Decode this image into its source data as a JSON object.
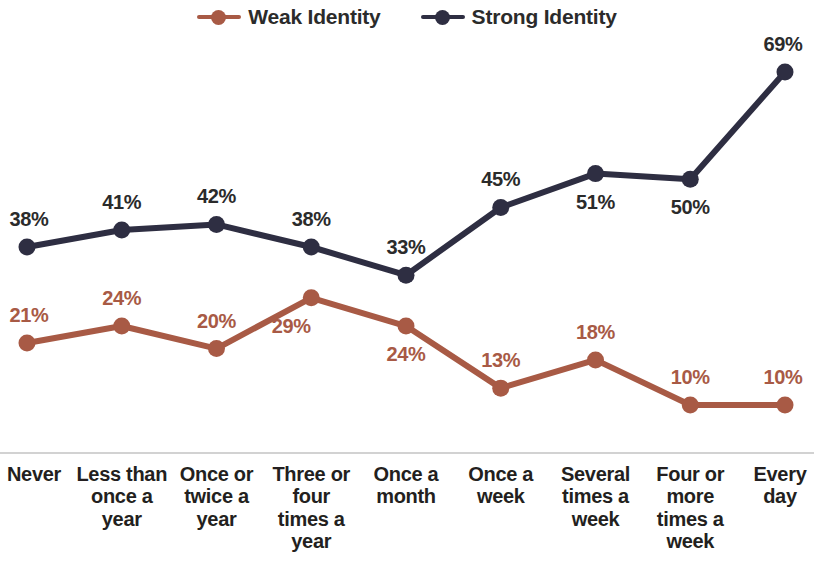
{
  "legend": {
    "items": [
      {
        "label": "Weak Identity",
        "color": "#a85a45",
        "marker": "line-dot-marker"
      },
      {
        "label": "Strong Identity",
        "color": "#2e2e42",
        "marker": "line-dot-marker"
      }
    ]
  },
  "axis": {
    "line_color": "#d2d2d2"
  },
  "chart_data": {
    "type": "line",
    "title": "",
    "subtitle": "",
    "xlabel": "",
    "ylabel": "",
    "grid": false,
    "legend_position": "top-center",
    "ylim": [
      0,
      75
    ],
    "value_suffix": "%",
    "categories": [
      "Never",
      "Less than once a year",
      "Once or twice a year",
      "Three or four times a year",
      "Once a month",
      "Once a week",
      "Several times a week",
      "Four or more times a week",
      "Every day"
    ],
    "category_lines": [
      [
        "Never"
      ],
      [
        "Less than",
        "once a",
        "year"
      ],
      [
        "Once or",
        "twice a",
        "year"
      ],
      [
        "Three or",
        "four",
        "times a",
        "year"
      ],
      [
        "Once a",
        "month"
      ],
      [
        "Once a",
        "week"
      ],
      [
        "Several",
        "times a",
        "week"
      ],
      [
        "Four or",
        "more",
        "times a",
        "week"
      ],
      [
        "Every",
        "day"
      ]
    ],
    "series": [
      {
        "name": "Weak Identity",
        "color": "#a85a45",
        "values": [
          21,
          24,
          20,
          29,
          24,
          13,
          18,
          10,
          10
        ],
        "labels": [
          "21%",
          "24%",
          "20%",
          "29%",
          "24%",
          "13%",
          "18%",
          "10%",
          "10%"
        ],
        "label_positions": [
          "above",
          "above",
          "above",
          "below-left",
          "below",
          "above",
          "above",
          "above",
          "above"
        ]
      },
      {
        "name": "Strong Identity",
        "color": "#2e2e42",
        "values": [
          38,
          41,
          42,
          38,
          33,
          45,
          51,
          50,
          69
        ],
        "labels": [
          "38%",
          "41%",
          "42%",
          "38%",
          "33%",
          "45%",
          "51%",
          "50%",
          "69%"
        ],
        "label_positions": [
          "above",
          "above",
          "above",
          "above",
          "above",
          "above",
          "below",
          "below",
          "above"
        ]
      }
    ]
  }
}
